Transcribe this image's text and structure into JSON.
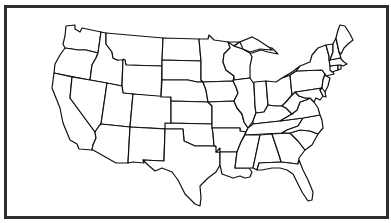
{
  "map": {
    "title": "United States outline map",
    "subject": "Contiguous United States (48 states)",
    "style": "blank outline, black borders on white",
    "frame_color": "#2e2e2e",
    "stroke_color": "#111111",
    "fill_color": "#ffffff",
    "labels_visible": false,
    "states": [
      {
        "id": "WA",
        "name": "Washington"
      },
      {
        "id": "OR",
        "name": "Oregon"
      },
      {
        "id": "CA",
        "name": "California"
      },
      {
        "id": "ID",
        "name": "Idaho"
      },
      {
        "id": "NV",
        "name": "Nevada"
      },
      {
        "id": "MT",
        "name": "Montana"
      },
      {
        "id": "WY",
        "name": "Wyoming"
      },
      {
        "id": "UT",
        "name": "Utah"
      },
      {
        "id": "AZ",
        "name": "Arizona"
      },
      {
        "id": "CO",
        "name": "Colorado"
      },
      {
        "id": "NM",
        "name": "New Mexico"
      },
      {
        "id": "ND",
        "name": "North Dakota"
      },
      {
        "id": "SD",
        "name": "South Dakota"
      },
      {
        "id": "NE",
        "name": "Nebraska"
      },
      {
        "id": "KS",
        "name": "Kansas"
      },
      {
        "id": "OK",
        "name": "Oklahoma"
      },
      {
        "id": "TX",
        "name": "Texas"
      },
      {
        "id": "MN",
        "name": "Minnesota"
      },
      {
        "id": "IA",
        "name": "Iowa"
      },
      {
        "id": "MO",
        "name": "Missouri"
      },
      {
        "id": "AR",
        "name": "Arkansas"
      },
      {
        "id": "LA",
        "name": "Louisiana"
      },
      {
        "id": "WI",
        "name": "Wisconsin"
      },
      {
        "id": "IL",
        "name": "Illinois"
      },
      {
        "id": "MI",
        "name": "Michigan"
      },
      {
        "id": "IN",
        "name": "Indiana"
      },
      {
        "id": "OH",
        "name": "Ohio"
      },
      {
        "id": "KY",
        "name": "Kentucky"
      },
      {
        "id": "TN",
        "name": "Tennessee"
      },
      {
        "id": "MS",
        "name": "Mississippi"
      },
      {
        "id": "AL",
        "name": "Alabama"
      },
      {
        "id": "GA",
        "name": "Georgia"
      },
      {
        "id": "FL",
        "name": "Florida"
      },
      {
        "id": "SC",
        "name": "South Carolina"
      },
      {
        "id": "NC",
        "name": "North Carolina"
      },
      {
        "id": "VA",
        "name": "Virginia"
      },
      {
        "id": "WV",
        "name": "West Virginia"
      },
      {
        "id": "PA",
        "name": "Pennsylvania"
      },
      {
        "id": "NY",
        "name": "New York"
      },
      {
        "id": "MD",
        "name": "Maryland"
      },
      {
        "id": "DE",
        "name": "Delaware"
      },
      {
        "id": "NJ",
        "name": "New Jersey"
      },
      {
        "id": "CT",
        "name": "Connecticut"
      },
      {
        "id": "RI",
        "name": "Rhode Island"
      },
      {
        "id": "MA",
        "name": "Massachusetts"
      },
      {
        "id": "VT",
        "name": "Vermont"
      },
      {
        "id": "NH",
        "name": "New Hampshire"
      },
      {
        "id": "ME",
        "name": "Maine"
      }
    ]
  }
}
